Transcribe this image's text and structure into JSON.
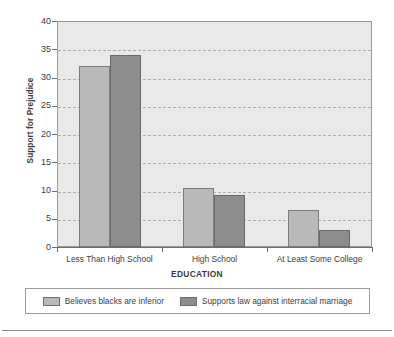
{
  "chart_data": {
    "type": "bar",
    "title": "",
    "xlabel": "EDUCATION",
    "ylabel": "Support for Prejudice",
    "categories": [
      "Less Than High School",
      "High School",
      "At Least Some College"
    ],
    "series": [
      {
        "name": "Believes blacks are inferior",
        "color": "#b9b9b9",
        "values": [
          32,
          10.5,
          6.5
        ]
      },
      {
        "name": "Supports law against interracial marriage",
        "color": "#8d8d8d",
        "values": [
          34,
          9.2,
          3
        ]
      }
    ],
    "ylim": [
      0,
      40
    ],
    "yticks": [
      0,
      5,
      10,
      15,
      20,
      25,
      30,
      35,
      40
    ],
    "ytick_labels": [
      "0",
      "5",
      "10",
      "15",
      "20",
      "25",
      "30",
      "35",
      "40"
    ],
    "grid": true,
    "grid_style": "dashed horizontal",
    "legend_position": "bottom",
    "plot_background": "#e9e9e9"
  },
  "axes": {
    "y_title": "Support for Prejudice",
    "x_title": "EDUCATION"
  },
  "legend": {
    "entries": [
      {
        "label": "Believes blacks are inferior",
        "swatch": "light"
      },
      {
        "label": "Supports law against interracial marriage",
        "swatch": "dark"
      }
    ]
  }
}
